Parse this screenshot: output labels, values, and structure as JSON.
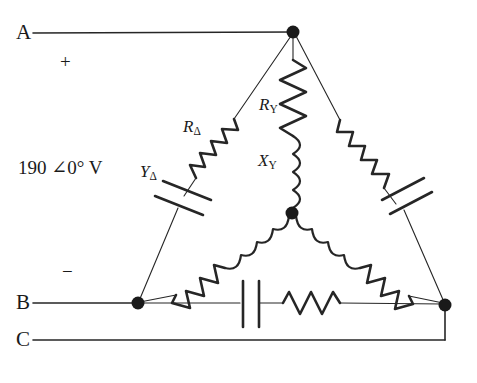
{
  "diagram": {
    "stroke_color": "#262626",
    "node_color": "#1a1a1a",
    "background": "#ffffff"
  },
  "terminals": [
    {
      "id": "A",
      "label": "A"
    },
    {
      "id": "B",
      "label": "B"
    },
    {
      "id": "C",
      "label": "C"
    }
  ],
  "polarity": {
    "plus": "+",
    "minus": "−"
  },
  "source": {
    "label": "190 ∠0° V",
    "magnitude": "190",
    "angle": "0°",
    "unit": "V"
  },
  "component_labels": {
    "r_delta": {
      "base": "R",
      "sub": "Δ"
    },
    "r_wye": {
      "base": "R",
      "sub": "Y"
    },
    "x_wye": {
      "base": "X",
      "sub": "Y"
    },
    "y_delta": {
      "base": "Y",
      "sub": "Δ"
    }
  },
  "nodes": [
    {
      "name": "top-vertex",
      "x": 293,
      "y": 32
    },
    {
      "name": "center-neutral",
      "x": 292,
      "y": 213
    },
    {
      "name": "bottom-left-vertex",
      "x": 138,
      "y": 303
    },
    {
      "name": "bottom-right-vertex",
      "x": 445,
      "y": 305
    }
  ],
  "branches": [
    {
      "name": "delta-left",
      "from": "top-vertex",
      "to": "bottom-left-vertex",
      "elements": [
        "resistor",
        "capacitor"
      ]
    },
    {
      "name": "delta-right",
      "from": "top-vertex",
      "to": "bottom-right-vertex",
      "elements": [
        "resistor",
        "capacitor"
      ]
    },
    {
      "name": "delta-bottom",
      "from": "bottom-left-vertex",
      "to": "bottom-right-vertex",
      "elements": [
        "capacitor",
        "resistor"
      ]
    },
    {
      "name": "wye-top",
      "from": "top-vertex",
      "to": "center-neutral",
      "elements": [
        "resistor",
        "inductor"
      ]
    },
    {
      "name": "wye-left",
      "from": "center-neutral",
      "to": "bottom-left-vertex",
      "elements": [
        "inductor",
        "resistor"
      ]
    },
    {
      "name": "wye-right",
      "from": "center-neutral",
      "to": "bottom-right-vertex",
      "elements": [
        "inductor",
        "resistor"
      ]
    }
  ]
}
